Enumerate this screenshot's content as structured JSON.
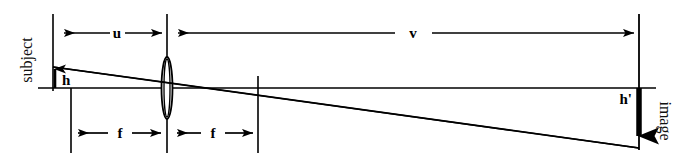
{
  "figure": {
    "type": "optics-ray-diagram",
    "background_color": "#ffffff",
    "line_color": "#000000",
    "width": 693,
    "height": 163
  },
  "labels": {
    "subject": "subject",
    "image": "image",
    "object_distance": "u",
    "image_distance": "v",
    "focal_length_left": "f",
    "focal_length_right": "f",
    "object_height": "h",
    "image_height": "h'"
  },
  "elements": {
    "subject_plane": "subject-plane-line",
    "lens": "converging-lens",
    "optical_axis": "optical-axis",
    "image_plane": "image-plane-line",
    "focal_point_left": "focal-point-left-marker",
    "focal_point_right": "focal-point-right-marker",
    "ray_through_center": "chief-ray",
    "ray_parallel": "parallel-ray",
    "object_arrow": "object-height-arrow",
    "image_arrow": "image-height-arrow"
  },
  "geometry": {
    "subject_x": 53,
    "lens_x": 167,
    "focal_right_x": 258,
    "image_x": 639,
    "axis_y": 88,
    "object_top_y": 67,
    "image_bottom_y": 148
  },
  "dimension_arrows": {
    "u": {
      "from": 53,
      "to": 167,
      "y": 33,
      "label": "u"
    },
    "v": {
      "from": 172,
      "to": 637,
      "y": 33,
      "label": "v"
    },
    "f_left": {
      "from": 72,
      "to": 164,
      "y": 133,
      "label": "f"
    },
    "f_right": {
      "from": 172,
      "to": 258,
      "y": 133,
      "label": "f"
    }
  }
}
